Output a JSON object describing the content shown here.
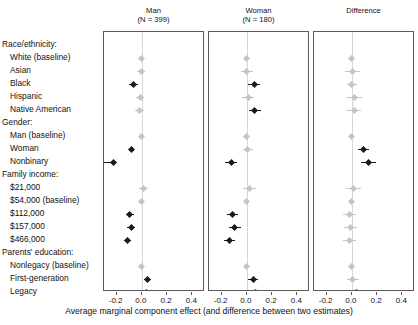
{
  "chart_data": {
    "type": "scatter",
    "plot_style": "forest-plot",
    "xlabel": "Average marginal component effect (and difference between two estimates)",
    "xlim": [
      -0.3,
      0.5
    ],
    "xticks": [
      -0.2,
      0.0,
      0.2,
      0.4
    ],
    "xticklabels": [
      "-0.2",
      "0.0",
      "0.2",
      "0.4"
    ],
    "grid": true,
    "gridline_at": 0.0,
    "legend": "none",
    "categories": [
      "Race/ethnicity:",
      "White (baseline)",
      "Asian",
      "Black",
      "Hispanic",
      "Native American",
      "Gender:",
      "Man (baseline)",
      "Woman",
      "Nonbinary",
      "Family income:",
      "$21,000",
      "$54,000 (baseline)",
      "$112,000",
      "$157,000",
      "$466,000",
      "Parents' education:",
      "Nonlegacy (baseline)",
      "First-generation",
      "Legacy"
    ],
    "panels": [
      {
        "title": "Man",
        "subtitle": "(N = 399)",
        "points": [
          {
            "row": "White (baseline)",
            "estimate": 0.0,
            "lo": 0.0,
            "hi": 0.0,
            "significant": false,
            "baseline": true
          },
          {
            "row": "Asian",
            "estimate": -0.005,
            "lo": -0.035,
            "hi": 0.025,
            "significant": false,
            "baseline": false
          },
          {
            "row": "Black",
            "estimate": -0.065,
            "lo": -0.1,
            "hi": -0.03,
            "significant": true,
            "baseline": false
          },
          {
            "row": "Hispanic",
            "estimate": -0.012,
            "lo": -0.045,
            "hi": 0.02,
            "significant": false,
            "baseline": false
          },
          {
            "row": "Native American",
            "estimate": -0.018,
            "lo": -0.052,
            "hi": 0.016,
            "significant": false,
            "baseline": false
          },
          {
            "row": "Man (baseline)",
            "estimate": 0.0,
            "lo": 0.0,
            "hi": 0.0,
            "significant": false,
            "baseline": true
          },
          {
            "row": "Woman",
            "estimate": -0.085,
            "lo": -0.105,
            "hi": -0.065,
            "significant": true,
            "baseline": false
          },
          {
            "row": "Nonbinary",
            "estimate": -0.225,
            "lo": -0.3,
            "hi": -0.2,
            "significant": true,
            "baseline": false
          },
          {
            "row": "$21,000",
            "estimate": 0.012,
            "lo": -0.02,
            "hi": 0.045,
            "significant": false,
            "baseline": false
          },
          {
            "row": "$54,000 (baseline)",
            "estimate": 0.0,
            "lo": 0.0,
            "hi": 0.0,
            "significant": false,
            "baseline": true
          },
          {
            "row": "$112,000",
            "estimate": -0.095,
            "lo": -0.125,
            "hi": -0.065,
            "significant": true,
            "baseline": false
          },
          {
            "row": "$157,000",
            "estimate": -0.085,
            "lo": -0.115,
            "hi": -0.055,
            "significant": true,
            "baseline": false
          },
          {
            "row": "$466,000",
            "estimate": -0.115,
            "lo": -0.145,
            "hi": -0.085,
            "significant": true,
            "baseline": false
          },
          {
            "row": "Nonlegacy (baseline)",
            "estimate": 0.0,
            "lo": 0.0,
            "hi": 0.0,
            "significant": false,
            "baseline": true
          },
          {
            "row": "First-generation",
            "estimate": 0.042,
            "lo": 0.015,
            "hi": 0.07,
            "significant": true,
            "baseline": false
          },
          {
            "row": "Legacy",
            "estimate": 0.038,
            "lo": 0.01,
            "hi": 0.066,
            "significant": true,
            "baseline": false
          }
        ]
      },
      {
        "title": "Woman",
        "subtitle": "(N = 180)",
        "points": [
          {
            "row": "White (baseline)",
            "estimate": 0.0,
            "lo": 0.0,
            "hi": 0.0,
            "significant": false,
            "baseline": true
          },
          {
            "row": "Asian",
            "estimate": -0.002,
            "lo": -0.05,
            "hi": 0.046,
            "significant": false,
            "baseline": false
          },
          {
            "row": "Black",
            "estimate": 0.058,
            "lo": 0.012,
            "hi": 0.105,
            "significant": true,
            "baseline": false
          },
          {
            "row": "Hispanic",
            "estimate": 0.012,
            "lo": -0.035,
            "hi": 0.06,
            "significant": false,
            "baseline": false
          },
          {
            "row": "Native American",
            "estimate": 0.062,
            "lo": 0.015,
            "hi": 0.11,
            "significant": true,
            "baseline": false
          },
          {
            "row": "Man (baseline)",
            "estimate": 0.0,
            "lo": 0.0,
            "hi": 0.0,
            "significant": false,
            "baseline": true
          },
          {
            "row": "Woman",
            "estimate": 0.008,
            "lo": -0.032,
            "hi": 0.048,
            "significant": false,
            "baseline": false
          },
          {
            "row": "Nonbinary",
            "estimate": -0.125,
            "lo": -0.175,
            "hi": -0.075,
            "significant": true,
            "baseline": false
          },
          {
            "row": "$21,000",
            "estimate": 0.022,
            "lo": -0.03,
            "hi": 0.075,
            "significant": false,
            "baseline": false
          },
          {
            "row": "$54,000 (baseline)",
            "estimate": 0.0,
            "lo": 0.0,
            "hi": 0.0,
            "significant": false,
            "baseline": true
          },
          {
            "row": "$112,000",
            "estimate": -0.112,
            "lo": -0.155,
            "hi": -0.068,
            "significant": true,
            "baseline": false
          },
          {
            "row": "$157,000",
            "estimate": -0.095,
            "lo": -0.14,
            "hi": -0.05,
            "significant": true,
            "baseline": false
          },
          {
            "row": "$466,000",
            "estimate": -0.135,
            "lo": -0.178,
            "hi": -0.092,
            "significant": true,
            "baseline": false
          },
          {
            "row": "Nonlegacy (baseline)",
            "estimate": 0.0,
            "lo": 0.0,
            "hi": 0.0,
            "significant": false,
            "baseline": true
          },
          {
            "row": "First-generation",
            "estimate": 0.052,
            "lo": 0.012,
            "hi": 0.092,
            "significant": true,
            "baseline": false
          },
          {
            "row": "Legacy",
            "estimate": 0.072,
            "lo": 0.03,
            "hi": 0.115,
            "significant": true,
            "baseline": false
          }
        ]
      },
      {
        "title": "Difference",
        "subtitle": "",
        "points": [
          {
            "row": "White (baseline)",
            "estimate": 0.0,
            "lo": 0.0,
            "hi": 0.0,
            "significant": false,
            "baseline": true
          },
          {
            "row": "Asian",
            "estimate": 0.005,
            "lo": -0.052,
            "hi": 0.062,
            "significant": false,
            "baseline": false
          },
          {
            "row": "Black",
            "estimate": 0.0,
            "lo": -0.042,
            "hi": 0.042,
            "significant": false,
            "baseline": false
          },
          {
            "row": "Hispanic",
            "estimate": 0.022,
            "lo": -0.035,
            "hi": 0.08,
            "significant": false,
            "baseline": false
          },
          {
            "row": "Native American",
            "estimate": 0.018,
            "lo": -0.04,
            "hi": 0.075,
            "significant": false,
            "baseline": false
          },
          {
            "row": "Man (baseline)",
            "estimate": 0.0,
            "lo": 0.0,
            "hi": 0.0,
            "significant": false,
            "baseline": true
          },
          {
            "row": "Woman",
            "estimate": 0.092,
            "lo": 0.048,
            "hi": 0.135,
            "significant": true,
            "baseline": false
          },
          {
            "row": "Nonbinary",
            "estimate": 0.135,
            "lo": 0.075,
            "hi": 0.195,
            "significant": true,
            "baseline": false
          },
          {
            "row": "$21,000",
            "estimate": 0.012,
            "lo": -0.048,
            "hi": 0.072,
            "significant": false,
            "baseline": false
          },
          {
            "row": "$54,000 (baseline)",
            "estimate": 0.0,
            "lo": 0.0,
            "hi": 0.0,
            "significant": false,
            "baseline": true
          },
          {
            "row": "$112,000",
            "estimate": -0.018,
            "lo": -0.07,
            "hi": 0.035,
            "significant": false,
            "baseline": false
          },
          {
            "row": "$157,000",
            "estimate": -0.012,
            "lo": -0.065,
            "hi": 0.04,
            "significant": false,
            "baseline": false
          },
          {
            "row": "$466,000",
            "estimate": -0.02,
            "lo": -0.072,
            "hi": 0.032,
            "significant": false,
            "baseline": false
          },
          {
            "row": "Nonlegacy (baseline)",
            "estimate": 0.0,
            "lo": 0.0,
            "hi": 0.0,
            "significant": false,
            "baseline": true
          },
          {
            "row": "First-generation",
            "estimate": 0.008,
            "lo": -0.04,
            "hi": 0.055,
            "significant": false,
            "baseline": false
          },
          {
            "row": "Legacy",
            "estimate": 0.035,
            "lo": -0.012,
            "hi": 0.082,
            "significant": true,
            "baseline": false
          }
        ]
      }
    ]
  }
}
